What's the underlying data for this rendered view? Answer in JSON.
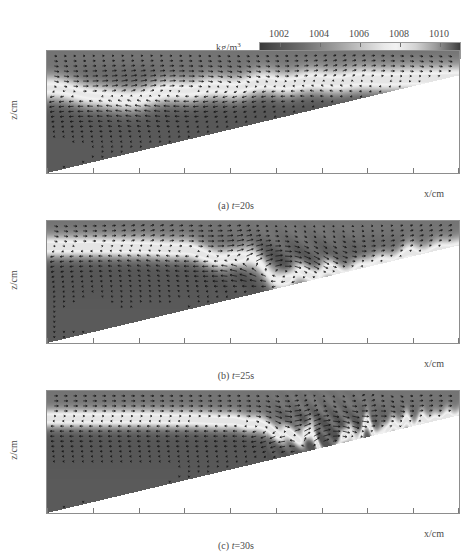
{
  "colorbar": {
    "unit_label": "kg/m",
    "unit_exp": "3",
    "ticks": [
      1002,
      1004,
      1006,
      1008,
      1010
    ],
    "vmin": 1001,
    "vmax": 1011,
    "name": "density-colorbar"
  },
  "axes": {
    "ylabel": "z/cm",
    "xlabel": "x/cm",
    "yticks": [
      0,
      -5,
      -10,
      -15
    ],
    "xticks": [
      0,
      5,
      10,
      15,
      20,
      25,
      30,
      35,
      40,
      45
    ],
    "xlim": [
      0,
      45
    ],
    "ylim": [
      -15,
      0
    ]
  },
  "panels": [
    {
      "caption_prefix": "(a)",
      "caption_var": "t",
      "caption_value": "=20s",
      "caption": "(a) t=20s",
      "time_s": 20
    },
    {
      "caption_prefix": "(b)",
      "caption_var": "t",
      "caption_value": "=25s",
      "caption": "(b) t=25s",
      "time_s": 25
    },
    {
      "caption_prefix": "(c)",
      "caption_var": "t",
      "caption_value": "=30s",
      "caption": "(c) t=30s",
      "time_s": 30
    }
  ],
  "chart_data": {
    "type": "heatmap",
    "title": "",
    "xlabel": "x/cm",
    "ylabel": "z/cm",
    "xlim": [
      0,
      45
    ],
    "ylim": [
      -15,
      0
    ],
    "colorbar_label": "kg/m3",
    "colorbar_ticks": [
      1002,
      1004,
      1006,
      1008,
      1010
    ],
    "colormap": "gray",
    "grid": false,
    "legend_position": "top",
    "overlay": "velocity-vector-field",
    "bathymetry": {
      "x": [
        0,
        45
      ],
      "z": [
        -15,
        -3
      ],
      "description": "linear sloping bottom"
    },
    "subplots": [
      {
        "label": "(a) t=20s",
        "time_s": 20,
        "pycnocline_depth_cm": -5,
        "features": "depressed interface, wave trough near x=5-12, smooth isopycnals",
        "interface_x": [
          0,
          5,
          10,
          15,
          20,
          25,
          30,
          35,
          40,
          45
        ],
        "interface_z": [
          -4.6,
          -5.6,
          -5.6,
          -5.0,
          -4.4,
          -4.0,
          -3.8,
          -3.6,
          -3.5,
          -3.4
        ]
      },
      {
        "label": "(b) t=25s",
        "time_s": 25,
        "pycnocline_depth_cm": -3.2,
        "features": "steepening wave front near x=20-27, plunging interface toward slope",
        "interface_x": [
          0,
          5,
          10,
          15,
          20,
          25,
          30,
          35,
          40,
          45
        ],
        "interface_z": [
          -3.2,
          -3.2,
          -3.3,
          -3.6,
          -4.6,
          -6.4,
          -6.8,
          -5.6,
          -4.2,
          -3.4
        ]
      },
      {
        "label": "(c) t=30s",
        "time_s": 30,
        "pycnocline_depth_cm": -3.4,
        "features": "breaking and overturning billow near x=27-32, mixed turbulent patch up the slope",
        "interface_x": [
          0,
          5,
          10,
          15,
          20,
          25,
          30,
          35,
          40,
          45
        ],
        "interface_z": [
          -3.4,
          -3.4,
          -3.4,
          -3.5,
          -3.7,
          -4.6,
          -7.2,
          -5.2,
          -4.0,
          -3.3
        ]
      }
    ]
  }
}
